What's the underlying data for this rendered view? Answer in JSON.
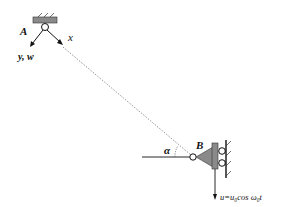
{
  "diagram": {
    "type": "mechanical schematic",
    "labels": {
      "point_A": "A",
      "point_B": "B",
      "axis_x": "x",
      "axis_y": "y, w",
      "angle": "α",
      "excitation": "u=u₀cos ω₀t"
    },
    "elements": [
      "fixed support with hinge at A",
      "dotted string/cable from A to B",
      "hinge at B with horizontal reference line",
      "triangular bracket on slider at B",
      "rollers against vertical wall",
      "downward displacement arrow u"
    ],
    "colors": {
      "support_fill": "#8a8a8a",
      "line": "#111111",
      "dotted": "#777777",
      "background": "#ffffff"
    }
  }
}
